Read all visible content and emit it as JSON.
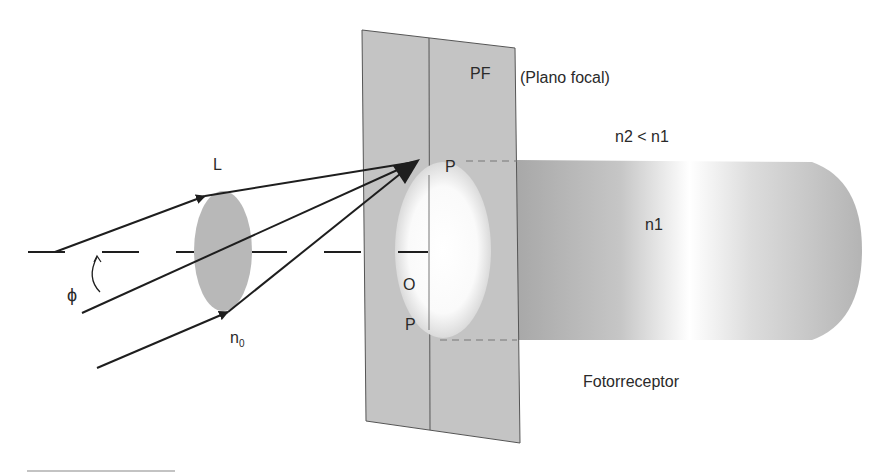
{
  "labels": {
    "pf": "PF",
    "plano_focal": "(Plano focal)",
    "n2_lt_n1": "n2 < n1",
    "n1": "n1",
    "L": "L",
    "P_top": "P",
    "O": "O",
    "P_bottom": "P",
    "phi": "ϕ",
    "n0_base": "n",
    "n0_sub": "0",
    "fotorreceptor": "Fotorreceptor"
  },
  "colors": {
    "plane_fill": "#c4c4c4",
    "plane_stroke": "#555555",
    "lens_fill": "#b8b8b8",
    "ray": "#1e1e1e",
    "cylinder_dark": "#a9a9a9",
    "cylinder_light": "#ffffff"
  }
}
